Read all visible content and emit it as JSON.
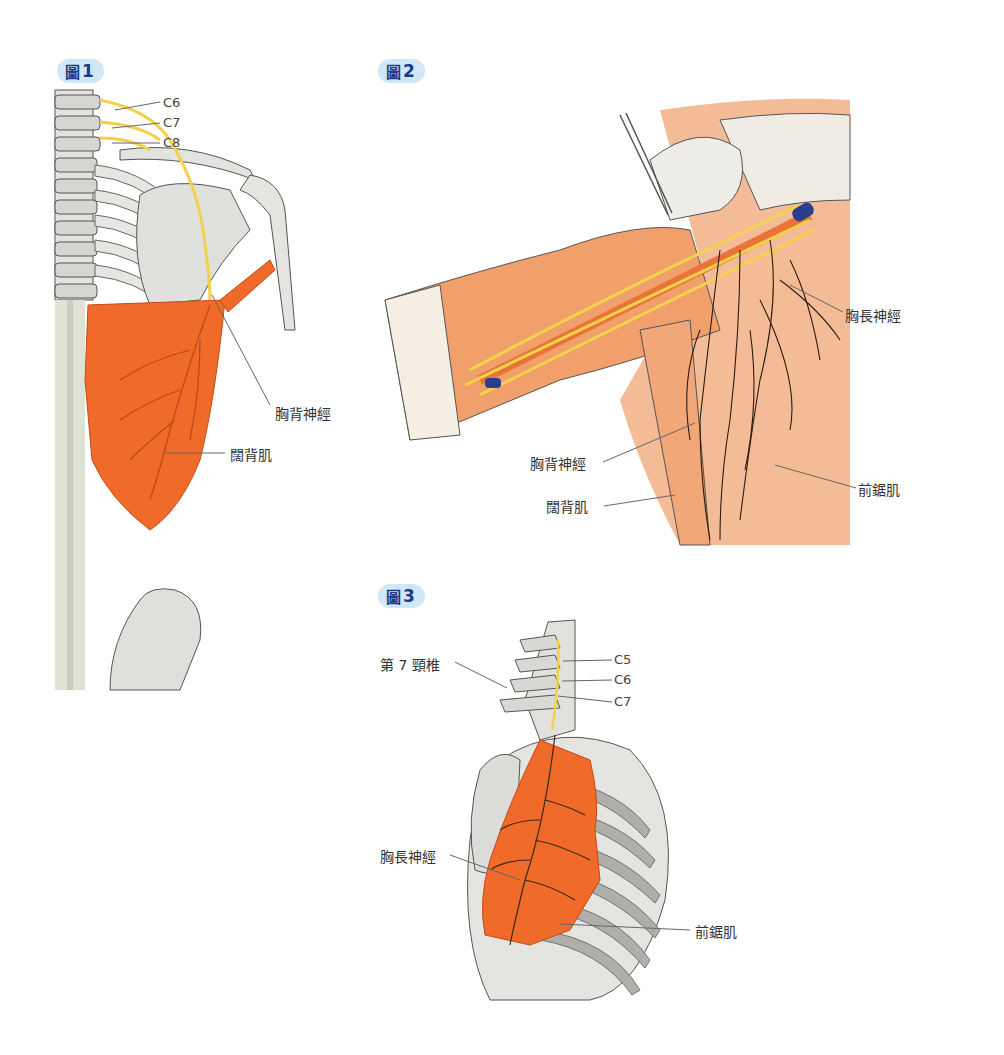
{
  "figures": [
    {
      "badge": {
        "glyph": "圖",
        "number": "1"
      },
      "labels": {
        "c6": "C6",
        "c7": "C7",
        "c8": "C8",
        "thoracodorsal_nerve": "胸背神經",
        "latissimus_dorsi": "闊背肌"
      }
    },
    {
      "badge": {
        "glyph": "圖",
        "number": "2"
      },
      "labels": {
        "long_thoracic_nerve": "胸長神經",
        "thoracodorsal_nerve": "胸背神經",
        "latissimus_dorsi": "闊背肌",
        "serratus_anterior": "前鋸肌"
      }
    },
    {
      "badge": {
        "glyph": "圖",
        "number": "3"
      },
      "labels": {
        "c5": "C5",
        "c6": "C6",
        "c7": "C7",
        "seventh_cervical": "第 7 頸椎",
        "long_thoracic_nerve": "胸長神經",
        "serratus_anterior": "前鋸肌"
      }
    }
  ],
  "colors": {
    "badge_bg": "#cfe7f6",
    "badge_text": "#1e3a8a",
    "muscle": "#f06a2a",
    "nerve": "#f2d24b",
    "bone": "#d9dad6",
    "vein": "#2b3d8f"
  }
}
